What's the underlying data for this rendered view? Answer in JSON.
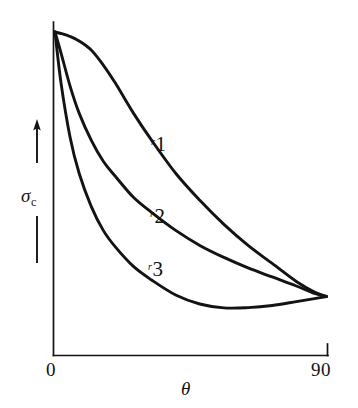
{
  "figure": {
    "background_color": "#ffffff",
    "ink_color": "#131313",
    "axis": {
      "x": {
        "title": "θ",
        "title_is_italic": true,
        "tick_labels": [
          "0",
          "90"
        ],
        "range": [
          0,
          90
        ],
        "units": "degrees",
        "has_end_tick": true
      },
      "y": {
        "symbol": "σ",
        "subscript": "c",
        "title": "σc",
        "tick_labels": [],
        "direction_arrow": "up",
        "arrow_icon_name": "up-arrow-icon"
      }
    },
    "curve_labels": [
      {
        "prefix": "r",
        "index": "1"
      },
      {
        "prefix": "r",
        "index": "2"
      },
      {
        "prefix": "r",
        "index": "3"
      }
    ]
  },
  "chart_data": {
    "type": "line",
    "title": "",
    "subtitle": "",
    "xlabel": "θ",
    "ylabel": "σc",
    "xlim": [
      0,
      90
    ],
    "ylim": [
      0,
      1
    ],
    "xticks": [
      0,
      90
    ],
    "xticklabels": [
      "0",
      "90"
    ],
    "yticks": [],
    "yticklabels": [],
    "grid": false,
    "legend": "inline-curve-labels",
    "legend_position": "inline",
    "axis_style": "open-left-bottom",
    "series": [
      {
        "name": "r1",
        "label": "r1",
        "color": "#131313",
        "x": [
          0,
          2,
          5,
          8,
          12,
          16,
          20,
          26,
          32,
          40,
          48,
          56,
          64,
          72,
          80,
          86,
          90
        ],
        "y": [
          1.0,
          0.995,
          0.985,
          0.97,
          0.94,
          0.89,
          0.83,
          0.73,
          0.64,
          0.53,
          0.44,
          0.36,
          0.29,
          0.23,
          0.17,
          0.135,
          0.12
        ]
      },
      {
        "name": "r2",
        "label": "r2",
        "color": "#131313",
        "x": [
          0,
          2,
          5,
          8,
          12,
          16,
          20,
          26,
          32,
          40,
          48,
          56,
          64,
          72,
          80,
          86,
          90
        ],
        "y": [
          1.0,
          0.93,
          0.82,
          0.73,
          0.64,
          0.57,
          0.52,
          0.45,
          0.4,
          0.34,
          0.29,
          0.25,
          0.215,
          0.185,
          0.155,
          0.13,
          0.12
        ]
      },
      {
        "name": "r3",
        "label": "r3",
        "color": "#131313",
        "x": [
          0,
          2,
          5,
          8,
          12,
          16,
          20,
          26,
          32,
          40,
          48,
          56,
          64,
          72,
          80,
          86,
          90
        ],
        "y": [
          1.0,
          0.83,
          0.65,
          0.53,
          0.42,
          0.34,
          0.285,
          0.22,
          0.175,
          0.125,
          0.095,
          0.082,
          0.083,
          0.09,
          0.103,
          0.113,
          0.12
        ]
      }
    ]
  }
}
